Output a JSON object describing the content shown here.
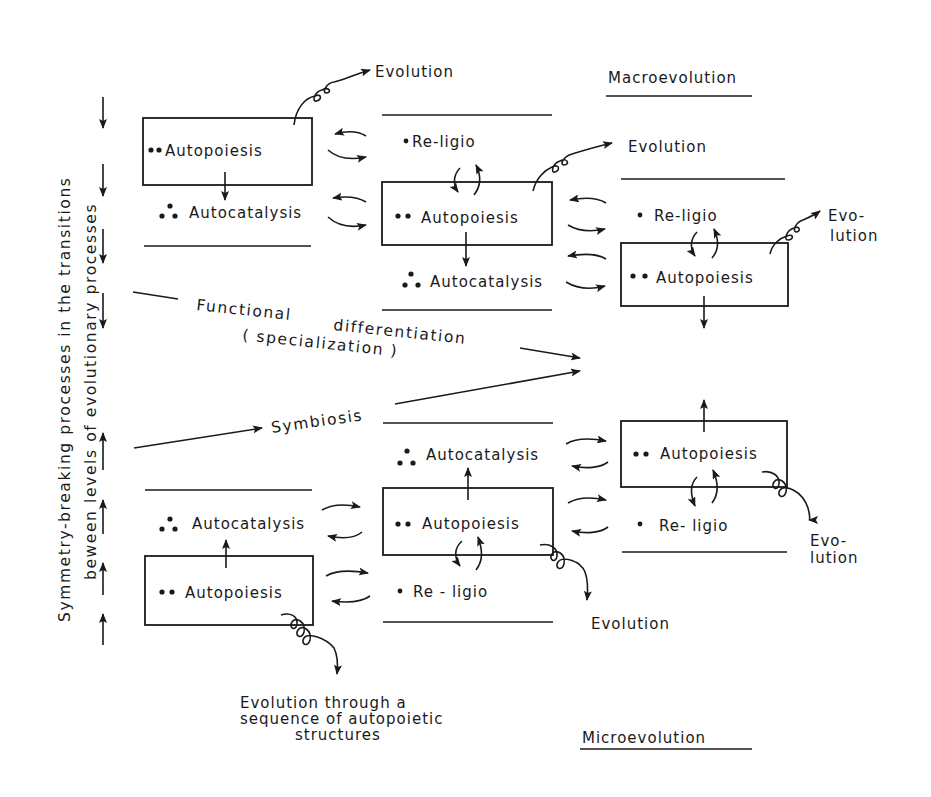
{
  "figure": {
    "side_label_line1": "Symmetry-breaking processes in the transitions",
    "side_label_line2": "beween levels of evolutionary processes",
    "macro_heading": "Macroevolution",
    "micro_heading": "Microevolution",
    "functional_label_1": "Functional",
    "functional_label_2": "differentiation",
    "functional_label_3": "( specialization )",
    "symbiosis_label": "Symbiosis",
    "bottom_caption": [
      "Evolution through a",
      "sequence of autopoietic",
      "structures"
    ]
  },
  "upper_levels": [
    {
      "autopoiesis": "Autopoiesis",
      "autocatalysis": "Autocatalysis",
      "evolution": "Evolution"
    },
    {
      "religio": "Re-ligio",
      "autopoiesis": "Autopoiesis",
      "autocatalysis": "Autocatalysis",
      "evolution": "Evolution"
    },
    {
      "religio": "Re-ligio",
      "autopoiesis": "Autopoiesis",
      "evolution_1": "Evo-",
      "evolution_2": "lution"
    }
  ],
  "lower_levels": [
    {
      "autocatalysis": "Autocatalysis",
      "autopoiesis": "Autopoiesis"
    },
    {
      "autocatalysis": "Autocatalysis",
      "autopoiesis": "Autopoiesis",
      "religio": "Re - ligio",
      "evolution": "Evolution"
    },
    {
      "autopoiesis": "Autopoiesis",
      "religio": "Re- ligio",
      "evolution_1": "Evo-",
      "evolution_2": "lution"
    }
  ],
  "side_arrows": {
    "down_count": 4,
    "up_count": 4
  }
}
